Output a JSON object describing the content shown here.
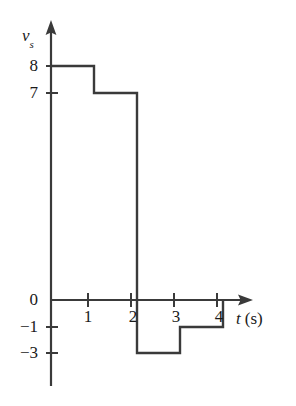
{
  "figure": {
    "name": "piecewise-source-voltage-plot",
    "background_color": "#ffffff",
    "line_color": "#3a3a3a",
    "text_color": "#1a1a1a"
  },
  "axes": {
    "y_axis_label_symbol": "v",
    "y_axis_label_subscript": "s",
    "x_axis_label_symbol": "t",
    "x_axis_label_unit": "(s)"
  },
  "chart_data": {
    "type": "line",
    "title": "",
    "subtitle": "",
    "xlabel": "t (s)",
    "ylabel": "v_s",
    "x_unit": "s",
    "grid": false,
    "legend": null,
    "step_style": "post",
    "xlim": [
      0,
      4.75
    ],
    "ylim": [
      -3.6,
      8.6
    ],
    "xticks": [
      1,
      2,
      3,
      4
    ],
    "xtick_labels": [
      "1",
      "2",
      "3",
      "4"
    ],
    "yticks": [
      8,
      7,
      0,
      -1,
      -3
    ],
    "ytick_labels": [
      "8",
      "7",
      "0",
      "−1",
      "−3"
    ],
    "segments": [
      {
        "t_start": 0,
        "t_end": 1,
        "value": 8
      },
      {
        "t_start": 1,
        "t_end": 2,
        "value": 7
      },
      {
        "t_start": 2,
        "t_end": 3,
        "value": -3
      },
      {
        "t_start": 3,
        "t_end": 4,
        "value": -1
      }
    ],
    "x": [
      0,
      1,
      1,
      2,
      2,
      3,
      3,
      4,
      4
    ],
    "values": [
      8,
      8,
      7,
      7,
      -3,
      -3,
      -1,
      -1,
      0
    ],
    "series": [
      {
        "name": "v_s(t)",
        "values": [
          8,
          8,
          7,
          7,
          -3,
          -3,
          -1,
          -1,
          0
        ]
      }
    ],
    "annotations": []
  },
  "labels": {
    "y_ticks": [
      {
        "text": "8",
        "value": 8
      },
      {
        "text": "7",
        "value": 7
      },
      {
        "text": "0",
        "value": 0
      },
      {
        "text": "−1",
        "value": -1
      },
      {
        "text": "−3",
        "value": -3
      }
    ],
    "x_ticks": [
      {
        "text": "1",
        "value": 1
      },
      {
        "text": "2",
        "value": 2
      },
      {
        "text": "3",
        "value": 3
      },
      {
        "text": "4",
        "value": 4
      }
    ]
  }
}
